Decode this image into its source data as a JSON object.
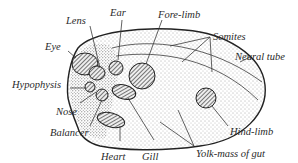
{
  "figure": {
    "labels": {
      "lens": "Lens",
      "ear": "Ear",
      "fore_limb": "Fore-limb",
      "somites": "Somites",
      "neural_tube": "Neural tube",
      "eye": "Eye",
      "hypophysis": "Hypophysis",
      "nose": "Nose",
      "balancer": "Balancer",
      "heart": "Heart",
      "gill": "Gill",
      "hind_limb": "Hind-limb",
      "yolk_mass": "Yolk-mass of gut"
    },
    "colors": {
      "ink": "#222222",
      "paper": "#ffffff",
      "label": "#2a2a2a"
    }
  }
}
